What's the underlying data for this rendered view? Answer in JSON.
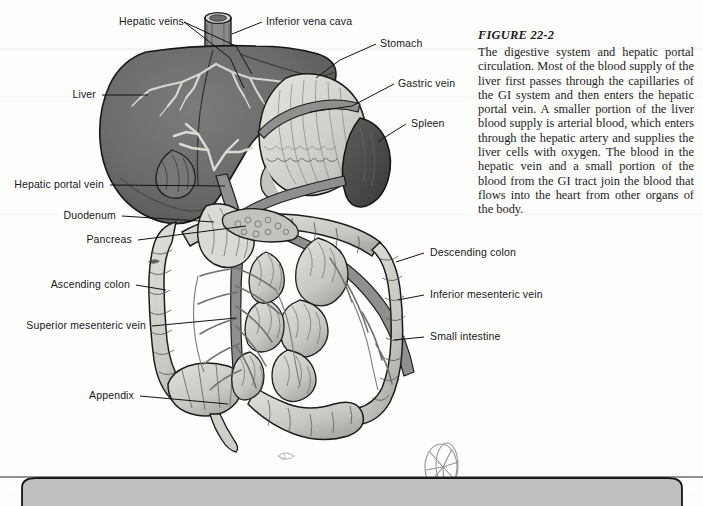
{
  "figure": {
    "number": "FIGURE 22-2",
    "caption": "The digestive system and hepatic portal circulation. Most of the blood supply of the liver first passes through the capillaries of the GI system and then enters the hepatic portal vein. A smaller portion of the liver blood supply is arterial blood, which enters through the hepatic artery and supplies the liver cells with oxygen. The blood in the hepatic vein and a small portion of the blood from the GI tract join the blood that flows into the heart from other organs of the body."
  },
  "colors": {
    "liver": "#6e6e6e",
    "spleen": "#4a4a4a",
    "stomach": "#d6d4cf",
    "intestine": "#cfcdc8",
    "vessel": "#8a8a8a",
    "ink": "#1a1a1a",
    "page": "#fdfdfc",
    "bottom_box": "#bcbcbc"
  },
  "labels": [
    {
      "id": "hepatic-veins",
      "text": "Hepatic veins"
    },
    {
      "id": "inferior-vena-cava",
      "text": "Inferior vena cava"
    },
    {
      "id": "stomach",
      "text": "Stomach"
    },
    {
      "id": "gastric-vein",
      "text": "Gastric vein"
    },
    {
      "id": "liver",
      "text": "Liver"
    },
    {
      "id": "spleen",
      "text": "Spleen"
    },
    {
      "id": "hepatic-portal-vein",
      "text": "Hepatic portal vein"
    },
    {
      "id": "duodenum",
      "text": "Duodenum"
    },
    {
      "id": "pancreas",
      "text": "Pancreas"
    },
    {
      "id": "descending-colon",
      "text": "Descending colon"
    },
    {
      "id": "ascending-colon",
      "text": "Ascending colon"
    },
    {
      "id": "inferior-mesenteric-vein",
      "text": "Inferior mesenteric vein"
    },
    {
      "id": "superior-mesenteric-vein",
      "text": "Superior mesenteric vein"
    },
    {
      "id": "small-intestine",
      "text": "Small intestine"
    },
    {
      "id": "appendix",
      "text": "Appendix"
    }
  ]
}
